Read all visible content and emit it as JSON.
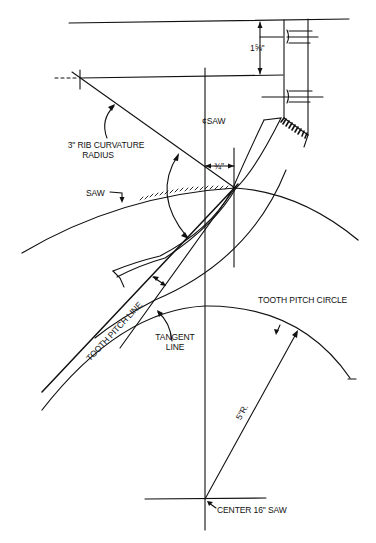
{
  "diagram": {
    "type": "technical-drawing",
    "labels": {
      "rib_radius_line1": "3\" RIB CURVATURE",
      "rib_radius_line2": "RADIUS",
      "saw_centerline": "¢SAW",
      "saw": "SAW",
      "offset_dim": "¾\"",
      "block_dim": "1⅝\"",
      "tooth_pitch_line": "TOOTH PITCH LINE",
      "tangent_line1": "TANGENT",
      "tangent_line2": "LINE",
      "tooth_pitch_circle": "TOOTH PITCH CIRCLE",
      "radius_dim": "5\"R.",
      "center": "CENTER 16\" SAW"
    },
    "colors": {
      "ink": "#111111",
      "background": "#ffffff"
    }
  }
}
